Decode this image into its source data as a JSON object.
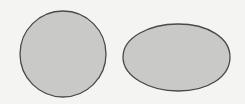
{
  "diagram": {
    "background": "#f4f4f2",
    "fill_color": "#c9c9c7",
    "stroke_color": "#4a4a4a",
    "shapes": [
      {
        "name": "circle",
        "kind": "circle",
        "cx": 63,
        "cy": 54,
        "r": 43
      },
      {
        "name": "ellipse",
        "kind": "egg-ellipse",
        "cx": 176,
        "cy": 57,
        "rx": 54,
        "ry": 34
      }
    ]
  }
}
